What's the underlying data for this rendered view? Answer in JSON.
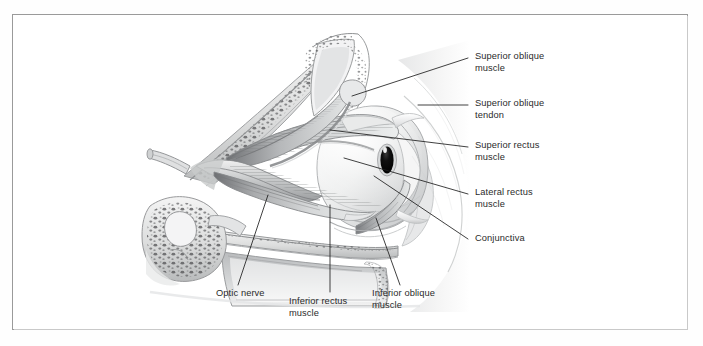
{
  "figure": {
    "kind": "anatomical-illustration",
    "style": "grayscale-pencil-rendering",
    "frame_color": "#9a9a9a",
    "label_color": "#2b2b2b",
    "leader_color": "#1f1f1f",
    "pupil_color": "#0d0d0d"
  },
  "labels": {
    "superior_oblique_muscle": "Superior oblique\nmuscle",
    "superior_oblique_tendon": "Superior oblique\ntendon",
    "superior_rectus_muscle": "Superior rectus\nmuscle",
    "lateral_rectus_muscle": "Lateral rectus\nmuscle",
    "conjunctiva": "Conjunctiva",
    "optic_nerve": "Optic nerve",
    "inferior_rectus_muscle": "Inferior rectus\nmuscle",
    "inferior_oblique_muscle": "Inferior oblique\nmuscle"
  }
}
